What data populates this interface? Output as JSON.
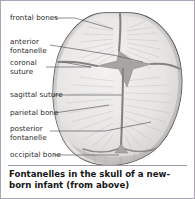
{
  "figure": {
    "caption": "Fontanelles in the skull of a new-born infant (from above)",
    "frame_border_color": "#a9a5b5",
    "background_color": "#ffffff"
  },
  "illustration": {
    "subject": "infant-skull-from-above",
    "view": "from above",
    "bone_fill_color": "#e6e4e2",
    "suture_color": "#8e8c8a",
    "fontanelle_color": "#a9a7a5",
    "outline_color": "#4a4a4a"
  },
  "labels": [
    {
      "id": "frontal-bones",
      "text": "frontal bones",
      "lines": [
        "frontal bones"
      ],
      "x": 9,
      "y": 14
    },
    {
      "id": "anterior-fontanelle",
      "text": "anterior fontanelle",
      "lines": [
        "anterior",
        "fontanelle"
      ],
      "x": 9,
      "y": 38
    },
    {
      "id": "coronal-suture",
      "text": "coronal suture",
      "lines": [
        "coronal",
        "suture"
      ],
      "x": 9,
      "y": 59
    },
    {
      "id": "sagittal-suture",
      "text": "sagittal suture",
      "lines": [
        "sagittal suture"
      ],
      "x": 9,
      "y": 91
    },
    {
      "id": "parietal-bone",
      "text": "parietal bone",
      "lines": [
        "parietal bone"
      ],
      "x": 9,
      "y": 109
    },
    {
      "id": "posterior-fontanelle",
      "text": "posterior fontanelle",
      "lines": [
        "posterior",
        "fontanelle"
      ],
      "x": 9,
      "y": 125
    },
    {
      "id": "occipital-bone",
      "text": "occipital bone",
      "lines": [
        "occipital bone"
      ],
      "x": 9,
      "y": 151
    }
  ]
}
